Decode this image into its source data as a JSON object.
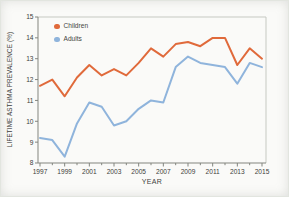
{
  "chart_data": {
    "type": "line",
    "title": "",
    "xlabel": "YEAR",
    "ylabel": "LIFETIME ASTHMA PREVALENCE (%)",
    "xlim": [
      1997,
      2015
    ],
    "ylim": [
      8,
      15
    ],
    "grid": false,
    "legend_position": "top-left",
    "yticks": [
      8,
      9,
      10,
      11,
      12,
      13,
      14,
      15
    ],
    "xtick_labels": [
      1997,
      1999,
      2001,
      2003,
      2005,
      2007,
      2009,
      2011,
      2013,
      2015
    ],
    "x": [
      1997,
      1998,
      1999,
      2000,
      2001,
      2002,
      2003,
      2004,
      2005,
      2006,
      2007,
      2008,
      2009,
      2010,
      2011,
      2012,
      2013,
      2014,
      2015
    ],
    "series": [
      {
        "name": "Children",
        "color": "#e06a3b",
        "values": [
          11.7,
          12.0,
          11.2,
          12.1,
          12.7,
          12.2,
          12.5,
          12.2,
          12.8,
          13.5,
          13.1,
          13.7,
          13.8,
          13.6,
          14.0,
          14.0,
          12.7,
          13.5,
          13.0
        ]
      },
      {
        "name": "Adults",
        "color": "#8fb4dc",
        "values": [
          9.2,
          9.1,
          8.3,
          9.9,
          10.9,
          10.7,
          9.8,
          10.0,
          10.6,
          11.0,
          10.9,
          12.6,
          13.1,
          12.8,
          12.7,
          12.6,
          11.8,
          12.8,
          12.6
        ]
      }
    ],
    "axis_colors": {
      "main": "#83857f",
      "box": "#c6c9c2",
      "tick_text": "#3e3e3c"
    }
  }
}
